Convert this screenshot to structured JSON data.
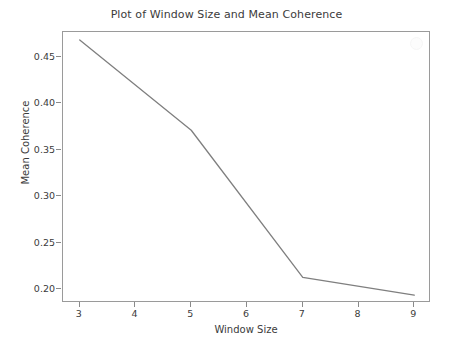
{
  "chart_data": {
    "type": "line",
    "title": "Plot of Window Size and Mean Coherence",
    "xlabel": "Window Size",
    "ylabel": "Mean Coherence",
    "x": [
      3,
      5,
      7,
      9
    ],
    "values": [
      0.468,
      0.371,
      0.213,
      0.194
    ],
    "series": [
      {
        "name": "Mean Coherence",
        "x": [
          3,
          5,
          7,
          9
        ],
        "values": [
          0.468,
          0.371,
          0.213,
          0.194
        ],
        "color": "#7f7f7f"
      }
    ],
    "xlim": [
      2.7,
      9.3
    ],
    "ylim": [
      0.1855,
      0.4765
    ],
    "xticks": [
      3,
      4,
      5,
      6,
      7,
      8,
      9
    ],
    "xtick_labels": [
      "3",
      "4",
      "5",
      "6",
      "7",
      "8",
      "9"
    ],
    "yticks": [
      0.2,
      0.25,
      0.3,
      0.35,
      0.4,
      0.45
    ],
    "ytick_labels": [
      "0.20",
      "0.25",
      "0.30",
      "0.35",
      "0.40",
      "0.45"
    ],
    "grid": false,
    "legend": false,
    "line_color": "#7f7f7f",
    "line_width": 1.3,
    "background_color": "#ffffff",
    "axes_color": "#9a9a9a"
  }
}
